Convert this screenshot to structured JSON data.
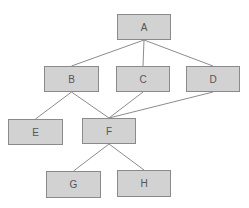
{
  "diagram": {
    "type": "tree",
    "colors": {
      "node_fill": "#d2d2d2",
      "node_border": "#8a8a8a",
      "edge": "#8c8c8c",
      "text": "#555555"
    },
    "nodes": [
      {
        "id": "A",
        "label": "A",
        "x": 117,
        "y": 14,
        "w": 54,
        "h": 26
      },
      {
        "id": "B",
        "label": "B",
        "x": 44,
        "y": 66,
        "w": 55,
        "h": 26
      },
      {
        "id": "C",
        "label": "C",
        "x": 116,
        "y": 66,
        "w": 54,
        "h": 26
      },
      {
        "id": "D",
        "label": "D",
        "x": 186,
        "y": 66,
        "w": 54,
        "h": 26
      },
      {
        "id": "E",
        "label": "E",
        "x": 8,
        "y": 119,
        "w": 55,
        "h": 26
      },
      {
        "id": "F",
        "label": "F",
        "x": 82,
        "y": 118,
        "w": 54,
        "h": 26
      },
      {
        "id": "G",
        "label": "G",
        "x": 46,
        "y": 171,
        "w": 55,
        "h": 27
      },
      {
        "id": "H",
        "label": "H",
        "x": 117,
        "y": 170,
        "w": 54,
        "h": 27
      }
    ],
    "edges": [
      {
        "from": "A",
        "to": "B"
      },
      {
        "from": "A",
        "to": "C"
      },
      {
        "from": "A",
        "to": "D"
      },
      {
        "from": "B",
        "to": "E"
      },
      {
        "from": "B",
        "to": "F"
      },
      {
        "from": "C",
        "to": "F"
      },
      {
        "from": "D",
        "to": "F"
      },
      {
        "from": "F",
        "to": "G"
      },
      {
        "from": "F",
        "to": "H"
      }
    ]
  }
}
